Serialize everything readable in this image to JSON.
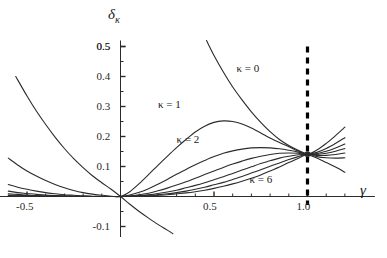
{
  "chart_data": {
    "type": "line",
    "title": "",
    "subtitle": "",
    "xlabel": "γ",
    "ylabel": "δκ",
    "ylabel_base": "δ",
    "ylabel_sub": "κ",
    "xlim": [
      -0.62,
      1.2
    ],
    "ylim": [
      -0.14,
      0.52
    ],
    "grid": false,
    "legend_position": "inline-annotations",
    "x_ticks_major": [
      -0.5,
      0.5,
      1.0
    ],
    "x_tick_labels": [
      "-0.5",
      "0.5",
      "1.0"
    ],
    "x_ticks_minor": [
      -0.4,
      -0.3,
      -0.2,
      -0.1,
      0.1,
      0.2,
      0.3,
      0.4,
      0.6,
      0.7,
      0.8,
      0.9,
      1.1,
      1.2
    ],
    "y_ticks_major": [
      -0.1,
      0.1,
      0.2,
      0.3,
      0.4,
      0.5
    ],
    "y_tick_labels": [
      "-0.1",
      "0.1",
      "0.2",
      "0.3",
      "0.4",
      "0.5"
    ],
    "y_ticks_minor": [
      -0.05,
      0.05,
      0.15,
      0.25,
      0.35,
      0.45
    ],
    "crossing_point": {
      "x": 1.0,
      "y": 0.141
    },
    "vertical_dashed_line": {
      "x": 1.0,
      "label": "",
      "style": "dashed",
      "color": "#000000"
    },
    "annotations": [
      {
        "text": "κ = 0",
        "x": 0.62,
        "y": 0.425
      },
      {
        "text": "κ = 1",
        "x": 0.2,
        "y": 0.305
      },
      {
        "text": "κ = 2",
        "x": 0.3,
        "y": 0.19
      },
      {
        "text": "κ = 6",
        "x": 0.69,
        "y": 0.055
      }
    ],
    "series": [
      {
        "name": "κ = 0",
        "kappa": 0,
        "points": [
          [
            -0.56,
            0.4
          ],
          [
            -0.5,
            0.335
          ],
          [
            -0.45,
            0.285
          ],
          [
            -0.4,
            0.24
          ],
          [
            -0.35,
            0.198
          ],
          [
            -0.3,
            0.16
          ],
          [
            -0.25,
            0.126
          ],
          [
            -0.2,
            0.096
          ],
          [
            -0.15,
            0.069
          ],
          [
            -0.1,
            0.046
          ],
          [
            -0.05,
            0.024
          ],
          [
            0.0,
            0.0
          ],
          [
            0.05,
            -0.026
          ],
          [
            0.1,
            -0.05
          ],
          [
            0.15,
            -0.072
          ],
          [
            0.2,
            -0.093
          ],
          [
            0.25,
            -0.112
          ],
          [
            0.28,
            -0.124
          ]
        ]
      },
      {
        "name": "κ = 0 rising branch",
        "kappa": 0,
        "points": [
          [
            0.46,
            0.52
          ],
          [
            0.5,
            0.47
          ],
          [
            0.55,
            0.415
          ],
          [
            0.6,
            0.365
          ],
          [
            0.65,
            0.322
          ],
          [
            0.7,
            0.282
          ],
          [
            0.75,
            0.247
          ],
          [
            0.8,
            0.216
          ],
          [
            0.85,
            0.19
          ],
          [
            0.9,
            0.17
          ],
          [
            0.95,
            0.154
          ],
          [
            1.0,
            0.141
          ],
          [
            1.05,
            0.128
          ],
          [
            1.1,
            0.113
          ],
          [
            1.15,
            0.098
          ],
          [
            1.2,
            0.081
          ]
        ]
      },
      {
        "name": "κ = 1",
        "kappa": 1,
        "points": [
          [
            -0.6,
            0.128
          ],
          [
            -0.55,
            0.105
          ],
          [
            -0.5,
            0.085
          ],
          [
            -0.45,
            0.068
          ],
          [
            -0.4,
            0.053
          ],
          [
            -0.35,
            0.04
          ],
          [
            -0.3,
            0.029
          ],
          [
            -0.25,
            0.02
          ],
          [
            -0.2,
            0.013
          ],
          [
            -0.15,
            0.008
          ],
          [
            -0.1,
            0.004
          ],
          [
            -0.05,
            0.001
          ],
          [
            0.0,
            0.0
          ],
          [
            0.05,
            0.016
          ],
          [
            0.1,
            0.043
          ],
          [
            0.15,
            0.073
          ],
          [
            0.2,
            0.104
          ],
          [
            0.25,
            0.134
          ],
          [
            0.3,
            0.163
          ],
          [
            0.35,
            0.19
          ],
          [
            0.4,
            0.215
          ],
          [
            0.45,
            0.234
          ],
          [
            0.5,
            0.247
          ],
          [
            0.55,
            0.252
          ],
          [
            0.6,
            0.25
          ],
          [
            0.65,
            0.242
          ],
          [
            0.7,
            0.228
          ],
          [
            0.75,
            0.212
          ],
          [
            0.8,
            0.195
          ],
          [
            0.85,
            0.18
          ],
          [
            0.9,
            0.166
          ],
          [
            0.95,
            0.152
          ],
          [
            1.0,
            0.141
          ],
          [
            1.05,
            0.155
          ],
          [
            1.1,
            0.177
          ],
          [
            1.15,
            0.203
          ],
          [
            1.2,
            0.231
          ]
        ]
      },
      {
        "name": "κ = 2",
        "kappa": 2,
        "points": [
          [
            -0.6,
            0.04
          ],
          [
            -0.55,
            0.031
          ],
          [
            -0.5,
            0.024
          ],
          [
            -0.45,
            0.018
          ],
          [
            -0.4,
            0.013
          ],
          [
            -0.35,
            0.009
          ],
          [
            -0.3,
            0.006
          ],
          [
            -0.25,
            0.004
          ],
          [
            -0.2,
            0.002
          ],
          [
            -0.15,
            0.001
          ],
          [
            -0.1,
            0.0
          ],
          [
            -0.05,
            0.0
          ],
          [
            0.0,
            0.0
          ],
          [
            0.05,
            0.005
          ],
          [
            0.1,
            0.014
          ],
          [
            0.15,
            0.026
          ],
          [
            0.2,
            0.041
          ],
          [
            0.25,
            0.057
          ],
          [
            0.3,
            0.074
          ],
          [
            0.35,
            0.09
          ],
          [
            0.4,
            0.106
          ],
          [
            0.45,
            0.12
          ],
          [
            0.5,
            0.133
          ],
          [
            0.55,
            0.144
          ],
          [
            0.6,
            0.152
          ],
          [
            0.65,
            0.158
          ],
          [
            0.7,
            0.162
          ],
          [
            0.75,
            0.163
          ],
          [
            0.8,
            0.162
          ],
          [
            0.85,
            0.159
          ],
          [
            0.9,
            0.154
          ],
          [
            0.95,
            0.148
          ],
          [
            1.0,
            0.141
          ],
          [
            1.05,
            0.147
          ],
          [
            1.1,
            0.16
          ],
          [
            1.15,
            0.177
          ],
          [
            1.2,
            0.196
          ]
        ]
      },
      {
        "name": "κ = 3",
        "kappa": 3,
        "points": [
          [
            -0.6,
            0.018
          ],
          [
            -0.55,
            0.013
          ],
          [
            -0.5,
            0.01
          ],
          [
            -0.45,
            0.007
          ],
          [
            -0.4,
            0.005
          ],
          [
            -0.35,
            0.003
          ],
          [
            -0.3,
            0.002
          ],
          [
            -0.25,
            0.001
          ],
          [
            -0.2,
            0.001
          ],
          [
            -0.15,
            0.0
          ],
          [
            -0.1,
            0.0
          ],
          [
            -0.05,
            0.0
          ],
          [
            0.0,
            0.0
          ],
          [
            0.05,
            0.002
          ],
          [
            0.1,
            0.006
          ],
          [
            0.15,
            0.011
          ],
          [
            0.2,
            0.019
          ],
          [
            0.25,
            0.028
          ],
          [
            0.3,
            0.038
          ],
          [
            0.35,
            0.049
          ],
          [
            0.4,
            0.061
          ],
          [
            0.45,
            0.073
          ],
          [
            0.5,
            0.085
          ],
          [
            0.55,
            0.097
          ],
          [
            0.6,
            0.108
          ],
          [
            0.65,
            0.118
          ],
          [
            0.7,
            0.127
          ],
          [
            0.75,
            0.134
          ],
          [
            0.8,
            0.14
          ],
          [
            0.85,
            0.144
          ],
          [
            0.9,
            0.145
          ],
          [
            0.95,
            0.144
          ],
          [
            1.0,
            0.141
          ],
          [
            1.05,
            0.143
          ],
          [
            1.1,
            0.151
          ],
          [
            1.15,
            0.162
          ],
          [
            1.2,
            0.175
          ]
        ]
      },
      {
        "name": "κ = 4",
        "kappa": 4,
        "points": [
          [
            -0.6,
            0.009
          ],
          [
            -0.55,
            0.007
          ],
          [
            -0.5,
            0.005
          ],
          [
            -0.45,
            0.003
          ],
          [
            -0.4,
            0.002
          ],
          [
            -0.35,
            0.002
          ],
          [
            -0.3,
            0.001
          ],
          [
            -0.25,
            0.001
          ],
          [
            -0.2,
            0.0
          ],
          [
            -0.15,
            0.0
          ],
          [
            -0.1,
            0.0
          ],
          [
            -0.05,
            0.0
          ],
          [
            0.0,
            0.0
          ],
          [
            0.05,
            0.001
          ],
          [
            0.1,
            0.003
          ],
          [
            0.15,
            0.006
          ],
          [
            0.2,
            0.01
          ],
          [
            0.25,
            0.015
          ],
          [
            0.3,
            0.021
          ],
          [
            0.35,
            0.029
          ],
          [
            0.4,
            0.037
          ],
          [
            0.45,
            0.046
          ],
          [
            0.5,
            0.056
          ],
          [
            0.55,
            0.066
          ],
          [
            0.6,
            0.077
          ],
          [
            0.65,
            0.088
          ],
          [
            0.7,
            0.099
          ],
          [
            0.75,
            0.11
          ],
          [
            0.8,
            0.119
          ],
          [
            0.85,
            0.128
          ],
          [
            0.9,
            0.134
          ],
          [
            0.95,
            0.139
          ],
          [
            1.0,
            0.141
          ],
          [
            1.05,
            0.14
          ],
          [
            1.1,
            0.144
          ],
          [
            1.15,
            0.151
          ],
          [
            1.2,
            0.16
          ]
        ]
      },
      {
        "name": "κ = 5",
        "kappa": 5,
        "points": [
          [
            -0.6,
            0.005
          ],
          [
            -0.55,
            0.004
          ],
          [
            -0.5,
            0.003
          ],
          [
            -0.45,
            0.002
          ],
          [
            -0.4,
            0.001
          ],
          [
            -0.35,
            0.001
          ],
          [
            -0.3,
            0.001
          ],
          [
            -0.25,
            0.0
          ],
          [
            -0.2,
            0.0
          ],
          [
            -0.15,
            0.0
          ],
          [
            -0.1,
            0.0
          ],
          [
            -0.05,
            0.0
          ],
          [
            0.0,
            0.0
          ],
          [
            0.05,
            0.0
          ],
          [
            0.1,
            0.002
          ],
          [
            0.15,
            0.004
          ],
          [
            0.2,
            0.006
          ],
          [
            0.25,
            0.009
          ],
          [
            0.3,
            0.013
          ],
          [
            0.35,
            0.018
          ],
          [
            0.4,
            0.024
          ],
          [
            0.45,
            0.031
          ],
          [
            0.5,
            0.039
          ],
          [
            0.55,
            0.047
          ],
          [
            0.6,
            0.057
          ],
          [
            0.65,
            0.067
          ],
          [
            0.7,
            0.078
          ],
          [
            0.75,
            0.089
          ],
          [
            0.8,
            0.101
          ],
          [
            0.85,
            0.112
          ],
          [
            0.9,
            0.123
          ],
          [
            0.95,
            0.133
          ],
          [
            1.0,
            0.141
          ],
          [
            1.05,
            0.137
          ],
          [
            1.1,
            0.137
          ],
          [
            1.15,
            0.14
          ],
          [
            1.2,
            0.145
          ]
        ]
      },
      {
        "name": "κ = 6",
        "kappa": 6,
        "points": [
          [
            -0.6,
            0.003
          ],
          [
            -0.55,
            0.002
          ],
          [
            -0.5,
            0.002
          ],
          [
            -0.45,
            0.001
          ],
          [
            -0.4,
            0.001
          ],
          [
            -0.35,
            0.0
          ],
          [
            -0.3,
            0.0
          ],
          [
            -0.25,
            0.0
          ],
          [
            -0.2,
            0.0
          ],
          [
            -0.15,
            0.0
          ],
          [
            -0.1,
            0.0
          ],
          [
            -0.05,
            0.0
          ],
          [
            0.0,
            0.0
          ],
          [
            0.05,
            0.0
          ],
          [
            0.1,
            0.001
          ],
          [
            0.15,
            0.002
          ],
          [
            0.2,
            0.004
          ],
          [
            0.25,
            0.006
          ],
          [
            0.3,
            0.009
          ],
          [
            0.35,
            0.012
          ],
          [
            0.4,
            0.016
          ],
          [
            0.45,
            0.021
          ],
          [
            0.5,
            0.027
          ],
          [
            0.55,
            0.034
          ],
          [
            0.6,
            0.042
          ],
          [
            0.65,
            0.051
          ],
          [
            0.7,
            0.061
          ],
          [
            0.75,
            0.072
          ],
          [
            0.8,
            0.085
          ],
          [
            0.85,
            0.098
          ],
          [
            0.9,
            0.113
          ],
          [
            0.95,
            0.127
          ],
          [
            1.0,
            0.141
          ],
          [
            1.05,
            0.133
          ],
          [
            1.1,
            0.129
          ],
          [
            1.15,
            0.128
          ],
          [
            1.2,
            0.129
          ]
        ]
      }
    ],
    "colors": {
      "curve": "#2b2b2b",
      "axis": "#2b2b2b",
      "dashed_line": "#000000",
      "background": "#ffffff"
    }
  }
}
